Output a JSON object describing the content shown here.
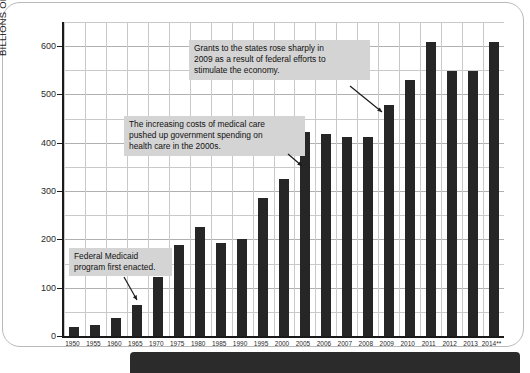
{
  "chart_data": {
    "type": "bar",
    "title": "",
    "xlabel": "",
    "ylabel": "BILLIONS OF CONSTANT (FY 2005) DOLLARS",
    "categories": [
      "1950",
      "1955",
      "1960",
      "1965",
      "1970",
      "1975",
      "1980",
      "1985",
      "1990",
      "1995",
      "2000",
      "2005",
      "2006",
      "2007",
      "2008",
      "2009",
      "2010",
      "2011",
      "2012",
      "2013",
      "2014**"
    ],
    "values": [
      18,
      22,
      38,
      65,
      122,
      188,
      226,
      192,
      200,
      285,
      325,
      422,
      418,
      412,
      412,
      478,
      530,
      608,
      548,
      548,
      608
    ],
    "ylim": [
      0,
      650
    ],
    "yticks": [
      0,
      100,
      200,
      300,
      400,
      500,
      600
    ],
    "ytick_labels": [
      "0",
      "100",
      "200",
      "300",
      "400",
      "500",
      "600"
    ],
    "minor_tick_step": 50,
    "grid": true,
    "legend": "none",
    "bar_color": "#262626",
    "annotations": [
      {
        "id": "grants-2009",
        "text": "Grants to the states rose sharply in\n2009 as a result of federal efforts to\nstimulate the economy.",
        "points_to_category": "2009"
      },
      {
        "id": "medical-costs-2000s",
        "text": "The increasing costs of medical care\npushed up government spending on\nhealth care in the 2000s.",
        "points_to_category": "2005"
      },
      {
        "id": "medicaid-1965",
        "text": "Federal Medicaid\nprogram first enacted.",
        "points_to_category": "1965"
      }
    ]
  },
  "colors": {
    "bar": "#262626",
    "annotation_background": "#d4d4d4",
    "grid": "#c9c9c9",
    "axis": "#1a1a1a",
    "page_border": "#b9b9b9",
    "bottom_band": "#2b2b2b"
  }
}
